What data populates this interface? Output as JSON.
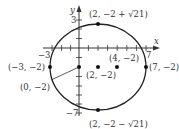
{
  "figure": {
    "type": "ellipse-graph",
    "equation_implied": "(x-2)^2/25 + (y+2)^2/21 = 1",
    "axes": {
      "x_label": "x",
      "y_label": "y",
      "x_tick_labels": [
        "−3",
        "7"
      ],
      "y_tick_labels": [
        "3",
        "−7"
      ]
    },
    "points": [
      {
        "label": "(2, −2 + √21)",
        "x": 2,
        "y": 2.58
      },
      {
        "label": "(2, −2 − √21)",
        "x": 2,
        "y": -6.58
      },
      {
        "label": "(−3, −2)",
        "x": -3,
        "y": -2
      },
      {
        "label": "(7, −2)",
        "x": 7,
        "y": -2
      },
      {
        "label": "(2, −2)",
        "x": 2,
        "y": -2
      },
      {
        "label": "(4, −2)",
        "x": 4,
        "y": -2
      },
      {
        "label": "(0, −2)",
        "x": 0,
        "y": -2
      }
    ],
    "colors": {
      "curve": "#222222",
      "axis": "#333333",
      "text": "#333333"
    }
  }
}
